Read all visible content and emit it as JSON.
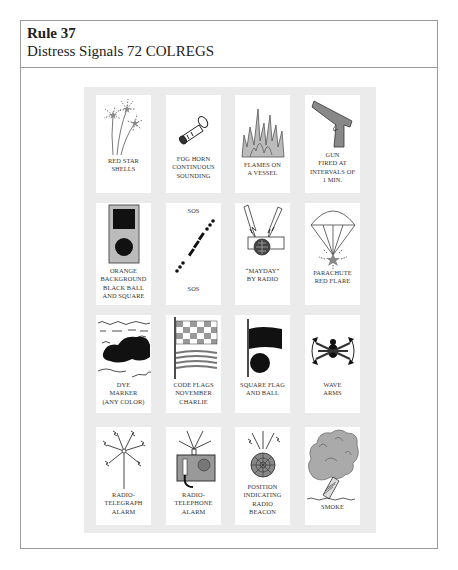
{
  "header": {
    "rule": "Rule 37",
    "subtitle": "Distress Signals 72 COLREGS"
  },
  "signals": [
    {
      "id": "red-star-shells",
      "icon": "fireworks-icon",
      "lines": [
        "RED STAR",
        "SHELLS"
      ]
    },
    {
      "id": "fog-horn",
      "icon": "fog-horn-icon",
      "lines": [
        "FOG HORN",
        "CONTINUOUS",
        "SOUNDING"
      ]
    },
    {
      "id": "flames",
      "icon": "flames-icon",
      "lines": [
        "FLAMES ON",
        "A VESSEL"
      ]
    },
    {
      "id": "gun",
      "icon": "gun-icon",
      "lines": [
        "GUN",
        "FIRED AT",
        "INTERVALS OF",
        "1 MIN."
      ]
    },
    {
      "id": "orange-background",
      "icon": "ball-square-icon",
      "lines": [
        "ORANGE",
        "BACKGROUND",
        "BLACK BALL",
        "AND SQUARE"
      ]
    },
    {
      "id": "sos",
      "icon": "sos-morse-icon",
      "top": "SOS",
      "lines": [
        "SOS"
      ]
    },
    {
      "id": "mayday",
      "icon": "radio-mayday-icon",
      "lines": [
        "“MAYDAY”",
        "BY RADIO"
      ]
    },
    {
      "id": "parachute-flare",
      "icon": "parachute-icon",
      "lines": [
        "PARACHUTE",
        "RED FLARE"
      ]
    },
    {
      "id": "dye-marker",
      "icon": "dye-marker-icon",
      "lines": [
        "DYE",
        "MARKER",
        "(ANY COLOR)"
      ]
    },
    {
      "id": "code-flags",
      "icon": "code-flags-icon",
      "lines": [
        "CODE FLAGS",
        "NOVEMBER",
        "CHARLIE"
      ]
    },
    {
      "id": "square-flag-ball",
      "icon": "flag-ball-icon",
      "lines": [
        "SQUARE FLAG",
        "AND BALL"
      ]
    },
    {
      "id": "wave-arms",
      "icon": "wave-arms-icon",
      "lines": [
        "WAVE",
        "ARMS"
      ]
    },
    {
      "id": "radio-telegraph",
      "icon": "antenna-icon",
      "lines": [
        "RADIO-",
        "TELEGRAPH",
        "ALARM"
      ]
    },
    {
      "id": "radio-telephone",
      "icon": "telephone-icon",
      "lines": [
        "RADIO-",
        "TELEPHONE",
        "ALARM"
      ]
    },
    {
      "id": "epirb",
      "icon": "beacon-icon",
      "lines": [
        "POSITION",
        "INDICATING",
        "RADIO",
        "BEACON"
      ]
    },
    {
      "id": "smoke",
      "icon": "smoke-icon",
      "lines": [
        "SMOKE"
      ]
    }
  ]
}
